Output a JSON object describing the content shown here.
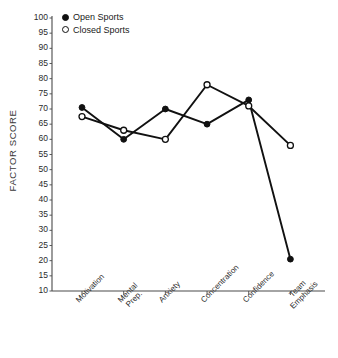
{
  "chart_data": {
    "type": "line",
    "title": "",
    "xlabel": "",
    "ylabel": "FACTOR SCORE",
    "ylim": [
      10,
      100
    ],
    "ytick_step": 5,
    "yticks": [
      100,
      95,
      90,
      85,
      80,
      75,
      70,
      65,
      60,
      55,
      50,
      45,
      40,
      35,
      30,
      25,
      20,
      15,
      10
    ],
    "grid": false,
    "legend_position": "top-left-inside",
    "categories": [
      "Motivation",
      "Mental Prep.",
      "Anxiety",
      "Concentration",
      "Confidence",
      "Team Emphasis"
    ],
    "series": [
      {
        "name": "Open Sports",
        "marker": "filled-circle",
        "color": "#111111",
        "values": [
          70.5,
          60,
          70,
          65,
          73,
          20.5
        ]
      },
      {
        "name": "Closed Sports",
        "marker": "open-circle",
        "color": "#111111",
        "values": [
          67.5,
          63,
          60,
          78,
          71,
          58
        ]
      }
    ]
  },
  "axis": {
    "y_label": "FACTOR SCORE",
    "y_tick_labels": [
      "100",
      "95",
      "90",
      "85",
      "80",
      "75",
      "70",
      "65",
      "60",
      "55",
      "50",
      "45",
      "40",
      "35",
      "30",
      "25",
      "20",
      "15",
      "10"
    ],
    "x_tick_labels": [
      {
        "line1": "Motivation",
        "line2": ""
      },
      {
        "line1": "Mental",
        "line2": "Prep."
      },
      {
        "line1": "Anxiety",
        "line2": ""
      },
      {
        "line1": "Concentration",
        "line2": ""
      },
      {
        "line1": "Confidence",
        "line2": ""
      },
      {
        "line1": "Team",
        "line2": "Emphasis"
      }
    ]
  },
  "legend": {
    "entries": [
      {
        "label": "Open Sports",
        "marker": "filled-circle"
      },
      {
        "label": "Closed Sports",
        "marker": "open-circle"
      }
    ]
  },
  "colors": {
    "line": "#111111",
    "axis": "#4a4a4a",
    "text": "#2b2b2b",
    "background": "#ffffff"
  }
}
